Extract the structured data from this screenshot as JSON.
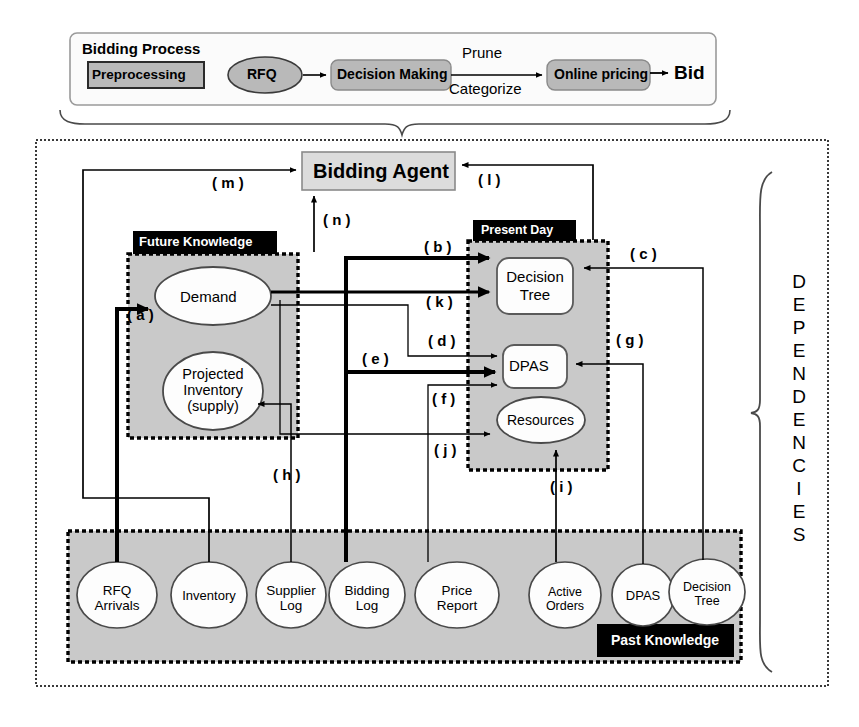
{
  "figure": {
    "type": "block-flow-dependency-diagram",
    "bidding_process": {
      "title": "Bidding Process",
      "nodes": [
        {
          "id": "preprocessing",
          "label": "Preprocessing",
          "shape": "rect-shaded"
        },
        {
          "id": "rfq",
          "label": "RFQ",
          "shape": "ellipse-shaded"
        },
        {
          "id": "decision_making",
          "label": "Decision Making",
          "shape": "roundrect-shaded"
        },
        {
          "id": "online_pricing",
          "label": "Online pricing",
          "shape": "roundrect-shaded"
        },
        {
          "id": "bid",
          "label": "Bid",
          "shape": "text-bold"
        }
      ],
      "edge_labels": [
        {
          "id": "prune",
          "label": "Prune"
        },
        {
          "id": "categorize",
          "label": "Categorize"
        }
      ]
    },
    "dependencies": {
      "side_label": "DEPENDENCIES",
      "side_label_letters": [
        "D",
        "E",
        "P",
        "E",
        "N",
        "D",
        "E",
        "N",
        "C",
        "I",
        "E",
        "S"
      ],
      "agent": {
        "id": "bidding_agent",
        "label": "Bidding Agent"
      },
      "groups": [
        {
          "id": "future_knowledge",
          "title": "Future Knowledge",
          "nodes": [
            {
              "id": "demand",
              "label": "Demand",
              "shape": "ellipse"
            },
            {
              "id": "projected_inventory",
              "label": "Projected\nInventory\n(supply)",
              "line1": "Projected",
              "line2": "Inventory",
              "line3": "(supply)",
              "shape": "ellipse"
            }
          ]
        },
        {
          "id": "present_day",
          "title": "Present Day",
          "nodes": [
            {
              "id": "decision_tree_present",
              "label": "Decision Tree",
              "line1": "Decision",
              "line2": "Tree",
              "shape": "roundrect"
            },
            {
              "id": "dpas_present",
              "label": "DPAS",
              "shape": "roundrect"
            },
            {
              "id": "resources",
              "label": "Resources",
              "shape": "ellipse"
            }
          ]
        },
        {
          "id": "past_knowledge",
          "title": "Past Knowledge",
          "nodes": [
            {
              "id": "rfq_arrivals",
              "label": "RFQ Arrivals",
              "line1": "RFQ",
              "line2": "Arrivals",
              "shape": "ellipse"
            },
            {
              "id": "inventory",
              "label": "Inventory",
              "line1": "Inventory",
              "line2": "",
              "shape": "ellipse"
            },
            {
              "id": "supplier_log",
              "label": "Supplier Log",
              "line1": "Supplier",
              "line2": "Log",
              "shape": "ellipse"
            },
            {
              "id": "bidding_log",
              "label": "Bidding Log",
              "line1": "Bidding",
              "line2": "Log",
              "shape": "ellipse"
            },
            {
              "id": "price_report",
              "label": "Price Report",
              "line1": "Price",
              "line2": "Report",
              "shape": "ellipse"
            },
            {
              "id": "active_orders",
              "label": "Active Orders",
              "line1": "Active",
              "line2": "Orders",
              "shape": "ellipse"
            },
            {
              "id": "dpas_past",
              "label": "DPAS",
              "line1": "DPAS",
              "line2": "",
              "shape": "ellipse"
            },
            {
              "id": "decision_tree_past",
              "label": "Decision Tree",
              "line1": "Decision",
              "line2": "Tree",
              "shape": "ellipse"
            }
          ]
        }
      ],
      "edge_labels": [
        {
          "id": "a",
          "label": "( a )",
          "from": "rfq_arrivals",
          "to": "demand",
          "weight": "thick"
        },
        {
          "id": "b",
          "label": "( b )",
          "from": "bidding_log",
          "to": "decision_tree_present",
          "weight": "thick"
        },
        {
          "id": "c",
          "label": "( c )",
          "from": "decision_tree_past",
          "to": "decision_tree_present",
          "weight": "thin"
        },
        {
          "id": "d",
          "label": "( d )",
          "from": "demand",
          "to": "dpas_present",
          "weight": "thin"
        },
        {
          "id": "e",
          "label": "( e )",
          "from": "bidding_log",
          "to": "dpas_present",
          "weight": "thick"
        },
        {
          "id": "f",
          "label": "( f )",
          "from": "price_report",
          "to": "dpas_present",
          "weight": "thin"
        },
        {
          "id": "g",
          "label": "( g )",
          "from": "dpas_past",
          "to": "dpas_present",
          "weight": "thin"
        },
        {
          "id": "h",
          "label": "( h )",
          "from": "supplier_log",
          "to": "projected_inventory",
          "weight": "thin"
        },
        {
          "id": "i",
          "label": "( i )",
          "from": "active_orders",
          "to": "resources",
          "weight": "thin"
        },
        {
          "id": "j",
          "label": "( j )",
          "from": "demand",
          "to": "resources",
          "weight": "thin"
        },
        {
          "id": "k",
          "label": "( k )",
          "from": "demand",
          "to": "decision_tree_present",
          "weight": "thick"
        },
        {
          "id": "l",
          "label": "( l )",
          "from": "present_day",
          "to": "bidding_agent",
          "weight": "thin"
        },
        {
          "id": "m",
          "label": "( m )",
          "from": "inventory",
          "to": "bidding_agent",
          "weight": "thin"
        },
        {
          "id": "n",
          "label": "( n )",
          "from": "future_knowledge",
          "to": "bidding_agent",
          "weight": "thin"
        }
      ]
    },
    "colors": {
      "shaded_fill": "#b9b9b9",
      "group_fill": "#c9c9c9",
      "agent_fill": "#dcdcdc",
      "header_fill": "#000000",
      "header_text": "#ffffff",
      "stroke": "#000000",
      "page_bg": "#ffffff"
    }
  }
}
